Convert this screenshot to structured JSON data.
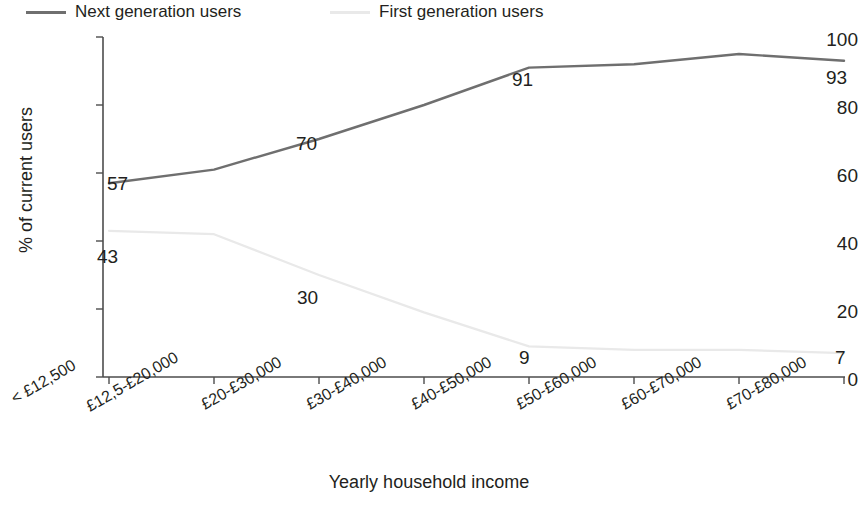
{
  "chart_data": {
    "type": "line",
    "title": "",
    "xlabel": "Yearly household income",
    "ylabel": "% of current users",
    "ylim": [
      0,
      100
    ],
    "yticks": [
      0,
      20,
      40,
      60,
      80,
      100
    ],
    "grid": false,
    "legend_position": "top-left",
    "categories": [
      "< £12,500",
      "£12,5-£20,000",
      "£20-£30,000",
      "£30-£40,000",
      "£40-£50,000",
      "£50-£60,000",
      "£60-£70,000",
      "£70-£80,000"
    ],
    "series": [
      {
        "name": "Next generation users",
        "color": "#6f6f6f",
        "values": [
          57,
          61,
          70,
          80,
          91,
          92,
          95,
          93
        ],
        "labeled_points": [
          {
            "index": 0,
            "value": 57
          },
          {
            "index": 2,
            "value": 70
          },
          {
            "index": 4,
            "value": 91
          },
          {
            "index": 7,
            "value": 93
          }
        ]
      },
      {
        "name": "First generation users",
        "color": "#e9e9e9",
        "values": [
          43,
          42,
          30,
          19,
          9,
          8,
          8,
          7
        ],
        "labeled_points": [
          {
            "index": 0,
            "value": 43
          },
          {
            "index": 2,
            "value": 30
          },
          {
            "index": 4,
            "value": 9
          },
          {
            "index": 7,
            "value": 7
          }
        ]
      }
    ]
  },
  "legend": {
    "items": [
      {
        "label": "Next generation users",
        "color": "#6f6f6f"
      },
      {
        "label": "First generation users",
        "color": "#e9e9e9"
      }
    ]
  },
  "axes": {
    "y_title": "% of current users",
    "x_title": "Yearly household income",
    "y_tick_labels": [
      "100",
      "80",
      "60",
      "40",
      "20",
      "0"
    ],
    "x_tick_labels": [
      "< £12,500",
      "£12,5-£20,000",
      "£20-£30,000",
      "£30-£40,000",
      "£40-£50,000",
      "£50-£60,000",
      "£60-£70,000",
      "£70-£80,000"
    ]
  },
  "data_labels": {
    "next": [
      "57",
      "70",
      "91",
      "93"
    ],
    "first": [
      "43",
      "30",
      "9",
      "7"
    ]
  },
  "footnote": {
    "text": ""
  }
}
